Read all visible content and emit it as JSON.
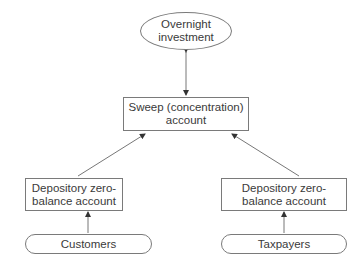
{
  "diagram": {
    "nodes": {
      "overnight": "Overnight investment",
      "sweep": "Sweep (concentration) account",
      "dza_left": "Depository zero-balance account",
      "dza_right": "Depository zero-balance account",
      "customers": "Customers",
      "taxpayers": "Taxpayers"
    },
    "edges": [
      {
        "from": "overnight",
        "to": "sweep",
        "type": "bidirectional"
      },
      {
        "from": "dza_left",
        "to": "sweep",
        "type": "arrow"
      },
      {
        "from": "dza_right",
        "to": "sweep",
        "type": "arrow"
      },
      {
        "from": "customers",
        "to": "dza_left",
        "type": "arrow"
      },
      {
        "from": "taxpayers",
        "to": "dza_right",
        "type": "arrow"
      }
    ]
  }
}
